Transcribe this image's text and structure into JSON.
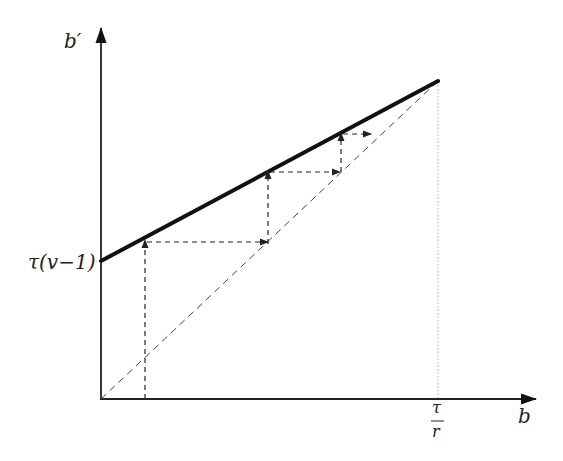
{
  "diagram": {
    "type": "cobweb",
    "axes": {
      "x_label": "b",
      "y_label": "b′",
      "y_intercept_label": "τ(v−1)",
      "x_tick_label_num": "τ",
      "x_tick_label_den": "r"
    },
    "elements": [
      {
        "name": "policy-line",
        "style": "thick solid",
        "from": "τ(v−1) at b=0",
        "to": "b=τ/r"
      },
      {
        "name": "45-degree-line",
        "style": "thin dashed",
        "from": "origin",
        "to": "b=τ/r"
      },
      {
        "name": "cobweb-steps",
        "style": "dashed arrows",
        "count": 3
      },
      {
        "name": "vertical-guide",
        "style": "dotted",
        "at": "b=τ/r"
      }
    ]
  },
  "colors": {
    "line": "#111111",
    "dashed": "#333333",
    "dotted": "#aaaaaa"
  }
}
